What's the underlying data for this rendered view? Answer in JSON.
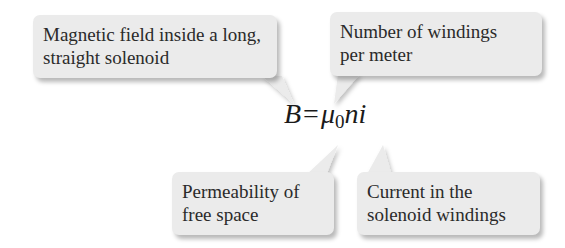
{
  "equation": {
    "lhs": "B",
    "operator": "=",
    "mu": "μ",
    "mu_subscript": "0",
    "rest": "ni"
  },
  "callouts": [
    {
      "id": "magnetic-field",
      "lines": [
        "Magnetic field inside a long,",
        "straight solenoid"
      ],
      "points_to": "B"
    },
    {
      "id": "windings-per-meter",
      "lines": [
        "Number of windings",
        "per meter"
      ],
      "points_to": "n"
    },
    {
      "id": "permeability",
      "lines": [
        "Permeability of",
        "free space"
      ],
      "points_to": "μ0"
    },
    {
      "id": "current",
      "lines": [
        "Current in the",
        "solenoid windings"
      ],
      "points_to": "i"
    }
  ],
  "colors": {
    "callout_fill": "#ebebeb",
    "text": "#2a2a2a",
    "background": "#ffffff"
  }
}
